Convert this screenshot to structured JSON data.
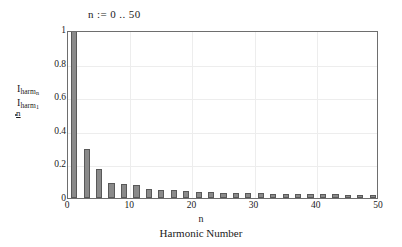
{
  "range_definition": "n :=  0 .. 50",
  "axes": {
    "ylabel": {
      "numerator_symbol": "I",
      "numerator_sub": "harm",
      "numerator_subsub": "n",
      "denominator_symbol": "I",
      "denominator_sub": "harm",
      "denominator_subsub": "1",
      "index_under": "n"
    },
    "xlabel_variable": "n",
    "xlabel_text": "Harmonic Number",
    "yticks": [
      "1",
      "0.8",
      "0.6",
      "0.4",
      "0.2",
      "0"
    ],
    "ytick_values": [
      1,
      0.8,
      0.6,
      0.4,
      0.2,
      0
    ],
    "xticks": [
      "0",
      "10",
      "20",
      "30",
      "40",
      "50"
    ],
    "xtick_values": [
      0,
      10,
      20,
      30,
      40,
      50
    ]
  },
  "colors": {
    "bar_fill": "#8a8a8a",
    "bar_edge": "#595959",
    "frame": "#6e6e6e",
    "grid": "#ededed",
    "text": "#1a1a1a",
    "background": "#ffffff"
  },
  "chart_data": {
    "type": "bar",
    "title": "n :=  0 .. 50",
    "xlabel": "Harmonic Number",
    "ylabel": "I_harm_n / I_harm_1",
    "xlim": [
      0,
      50
    ],
    "ylim": [
      0,
      1
    ],
    "grid": true,
    "legend": null,
    "bar_width_units": 1.0,
    "note": "Odd harmonics only; even harmonics are zero.",
    "x": [
      1,
      3,
      5,
      7,
      9,
      11,
      13,
      15,
      17,
      19,
      21,
      23,
      25,
      27,
      29,
      31,
      33,
      35,
      37,
      39,
      41,
      43,
      45,
      47,
      49
    ],
    "values": [
      1.0,
      0.29,
      0.175,
      0.087,
      0.083,
      0.076,
      0.052,
      0.05,
      0.045,
      0.042,
      0.036,
      0.034,
      0.031,
      0.03,
      0.028,
      0.027,
      0.026,
      0.025,
      0.024,
      0.023,
      0.022,
      0.021,
      0.02,
      0.019,
      0.018
    ]
  }
}
